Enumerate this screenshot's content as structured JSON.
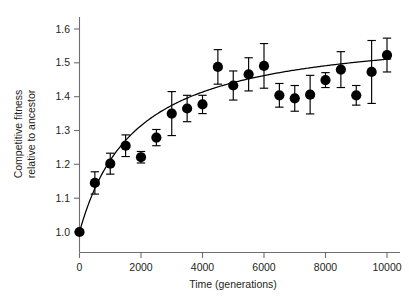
{
  "chart_data": {
    "type": "scatter",
    "title": "",
    "subtitle": "",
    "xlabel": "Time (generations)",
    "ylabel": "Competitive fitness\nrelative to ancestor",
    "ylabel_line1": "Competitive fitness",
    "ylabel_line2": "relative to ancestor",
    "xlim": [
      -400,
      10500
    ],
    "ylim": [
      0.955,
      1.635
    ],
    "xticks": [
      0,
      2000,
      4000,
      6000,
      8000,
      10000
    ],
    "xtick_labels": [
      "0",
      "2000",
      "4000",
      "6000",
      "8000",
      "10000"
    ],
    "yticks": [
      1.0,
      1.1,
      1.2,
      1.3,
      1.4,
      1.5,
      1.6
    ],
    "ytick_labels": [
      "1.0",
      "1.1",
      "1.2",
      "1.3",
      "1.4",
      "1.5",
      "1.6"
    ],
    "grid": false,
    "legend": null,
    "legend_position": "none",
    "marker": "filled-circle",
    "marker_color": "#000000",
    "errorbar_color": "#000000",
    "curve_color": "#000000",
    "axis_color": "#6d6e71",
    "background_color": "#ffffff",
    "x": [
      0,
      500,
      1000,
      1500,
      2000,
      2500,
      3000,
      3500,
      4000,
      4500,
      5000,
      5500,
      6000,
      6500,
      7000,
      7500,
      8000,
      8500,
      9000,
      9500,
      10000
    ],
    "y": [
      1.0,
      1.145,
      1.202,
      1.255,
      1.221,
      1.279,
      1.35,
      1.365,
      1.377,
      1.488,
      1.433,
      1.466,
      1.491,
      1.404,
      1.395,
      1.406,
      1.449,
      1.48,
      1.404,
      1.473,
      1.523
    ],
    "yerr": [
      0.005,
      0.033,
      0.031,
      0.032,
      0.017,
      0.024,
      0.065,
      0.039,
      0.027,
      0.051,
      0.043,
      0.049,
      0.066,
      0.035,
      0.038,
      0.057,
      0.022,
      0.053,
      0.029,
      0.093,
      0.05
    ],
    "series": [
      {
        "name": "Competitive fitness",
        "type": "scatter",
        "values": [
          1.0,
          1.145,
          1.202,
          1.255,
          1.221,
          1.279,
          1.35,
          1.365,
          1.377,
          1.488,
          1.433,
          1.466,
          1.491,
          1.404,
          1.395,
          1.406,
          1.449,
          1.48,
          1.404,
          1.473,
          1.523
        ]
      },
      {
        "name": "Hyperbolic fit",
        "type": "line",
        "model": "w = 1 + a*t/(t + b)",
        "a": 0.605,
        "b": 1850
      }
    ],
    "annotations": []
  }
}
